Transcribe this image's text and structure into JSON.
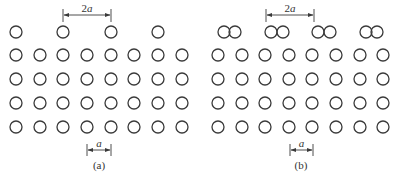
{
  "figure": {
    "atom_radius": 6,
    "row_y": [
      32,
      55,
      79,
      103,
      127
    ],
    "colors": {
      "stroke": "#3a3a3a",
      "background": "#ffffff"
    }
  },
  "panels": [
    {
      "id": "a",
      "caption": "(a)",
      "columns_x": [
        16,
        40,
        63,
        87,
        111,
        134,
        158,
        182
      ],
      "top_row_x": [
        16,
        63,
        111,
        158
      ],
      "top_dimension": {
        "label_num": "2",
        "label_var": "a",
        "x1": 63,
        "x2": 111
      },
      "bottom_dimension": {
        "label": "a",
        "x1": 87,
        "x2": 111
      },
      "caption_x": 99
    },
    {
      "id": "b",
      "caption": "(b)",
      "columns_x": [
        218,
        242,
        265,
        289,
        312,
        336,
        360,
        383
      ],
      "top_row_x": [
        224,
        235,
        271,
        283,
        318,
        330,
        366,
        377
      ],
      "top_dimension": {
        "label_num": "2",
        "label_var": "a",
        "x1": 266,
        "x2": 314
      },
      "bottom_dimension": {
        "label": "a",
        "x1": 290,
        "x2": 313
      },
      "caption_x": 301
    }
  ]
}
